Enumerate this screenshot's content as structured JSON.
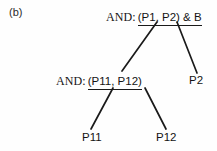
{
  "figure": {
    "label": "(b)",
    "background": "#fefefe",
    "ink": "#141414"
  },
  "tree": {
    "root": {
      "prefix": "AND:",
      "payload": "(P1, P2) & B"
    },
    "middle": {
      "prefix": "AND:",
      "payload": "(P11, P12)"
    },
    "leaves": {
      "p2": "P2",
      "p11": "P11",
      "p12": "P12"
    }
  },
  "edges": [
    {
      "name": "root-to-middle",
      "x1": 157,
      "y1": 22,
      "x2": 122,
      "y2": 71
    },
    {
      "name": "root-to-p2",
      "x1": 177,
      "y1": 22,
      "x2": 197,
      "y2": 73
    },
    {
      "name": "middle-to-p11",
      "x1": 113,
      "y1": 88,
      "x2": 91,
      "y2": 129
    },
    {
      "name": "middle-to-p12",
      "x1": 145,
      "y1": 88,
      "x2": 166,
      "y2": 129
    }
  ]
}
